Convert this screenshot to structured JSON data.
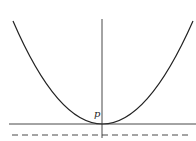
{
  "diagram": {
    "type": "parabola-with-directrix",
    "labels": {
      "point": "p"
    },
    "colors": {
      "stroke": "#222222",
      "background": "#ffffff"
    },
    "elements": {
      "parabola": {
        "vertex": [
          102,
          124
        ],
        "left_top": [
          13,
          21
        ],
        "right_top": [
          193,
          21
        ]
      },
      "axis_of_symmetry": {
        "x": 102,
        "y1": 19,
        "y2": 138
      },
      "tangent_line": {
        "y": 124,
        "x1": 9,
        "x2": 196
      },
      "directrix_dashed": {
        "y": 135,
        "x1": 12,
        "x2": 192
      }
    }
  }
}
